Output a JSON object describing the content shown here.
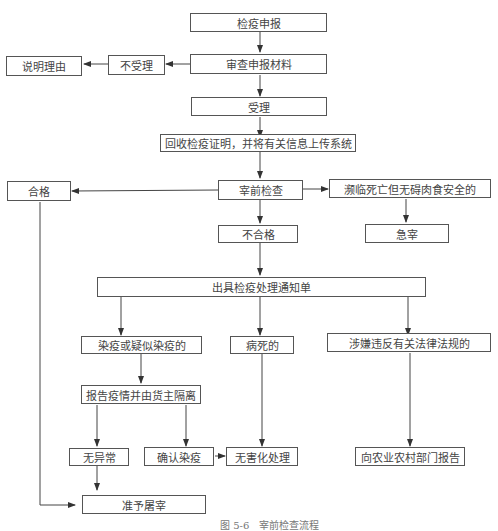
{
  "diagram": {
    "nodes": {
      "declare": "检疫申报",
      "review": "审查申报材料",
      "reject": "不受理",
      "explain": "说明理由",
      "accept": "受理",
      "recycle": "回收检疫证明，并将有关信息上传系统",
      "pre_inspect": "宰前检查",
      "qualified": "合格",
      "near_death": "濒临死亡但无碍肉食安全的",
      "unqualified": "不合格",
      "emergency": "急宰",
      "notice": "出具检疫处理通知单",
      "infected": "染疫或疑似染疫的",
      "dead": "病死的",
      "illegal": "涉嫌违反有关法律法规的",
      "report_isolate": "报告疫情并由货主隔离",
      "normal": "无异常",
      "confirmed": "确认染疫",
      "harmless": "无害化处理",
      "report_agri": "向农业农村部门报告",
      "slaughter": "准予屠宰"
    },
    "caption": "图 5-6　宰前检查流程",
    "line_color": "#333333"
  }
}
